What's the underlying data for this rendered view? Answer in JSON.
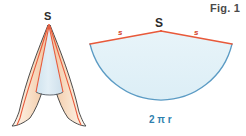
{
  "figure": {
    "caption": "Fig. 1",
    "background_color": "#ffffff",
    "width": 246,
    "height": 136
  },
  "cone": {
    "apex_label": "S",
    "inner_fill_color": "#dceaf2",
    "flap_fill_color": "#f7e0cb",
    "outline_color": "#3a3a3a",
    "slant_line_color": "#e8593a"
  },
  "sector": {
    "apex_label": "S",
    "slant_label_left": "s",
    "slant_label_right": "s",
    "arc_label": "2 π r",
    "fill_color": "#e4f2f7",
    "radius_line_color": "#e8593a",
    "arc_line_color": "#5b9bc4",
    "arc_label_color": "#2f7fae",
    "slant_label_color": "#d4452a"
  }
}
